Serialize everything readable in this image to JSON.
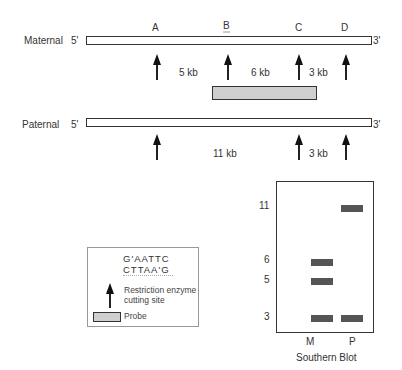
{
  "maternal": {
    "label": "Maternal",
    "five_prime": "5'",
    "three_prime": "3'",
    "sites": [
      "A",
      "B",
      "C",
      "D"
    ],
    "fragments": [
      "5 kb",
      "6 kb",
      "3 kb"
    ]
  },
  "paternal": {
    "label": "Paternal",
    "five_prime": "5'",
    "three_prime": "3'",
    "fragments": [
      "11 kb",
      "3 kb"
    ]
  },
  "legend": {
    "seq_top": "G'AATTC",
    "seq_bottom": "CTTAA'G",
    "arrow_label_line1": "Restriction enzyme",
    "arrow_label_line2": "cutting site",
    "probe_label": "Probe"
  },
  "southern_blot": {
    "title": "Southern Blot",
    "size_labels": [
      "11",
      "6",
      "5",
      "3"
    ],
    "lanes": [
      "M",
      "P"
    ],
    "bands": {
      "M": [
        6,
        5,
        3
      ],
      "P": [
        11,
        3
      ]
    }
  },
  "colors": {
    "band": "#555555",
    "probe_fill": "#cfcfcf",
    "outline": "#333333"
  }
}
